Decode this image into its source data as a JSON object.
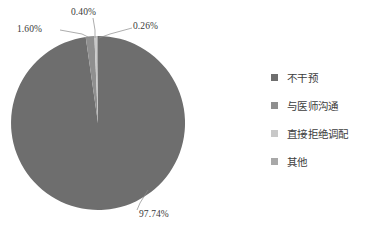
{
  "chart_data": {
    "type": "pie",
    "title": "",
    "categories": [
      "不干预",
      "与医师沟通",
      "直接拒绝调配",
      "其他"
    ],
    "values": [
      97.74,
      1.6,
      0.4,
      0.26
    ],
    "value_unit": "%",
    "data_labels": [
      "97.74%",
      "1.60%",
      "0.40%",
      "0.26%"
    ],
    "colors": [
      "#6e6e6e",
      "#8f8f8f",
      "#c8c8c8",
      "#a8a8a8"
    ],
    "legend_position": "right",
    "grid": false,
    "start_angle_deg": -90,
    "direction": "clockwise"
  },
  "labels": {
    "slice_main": "97.74%",
    "slice_second": "1.60%",
    "slice_third": "0.40%",
    "slice_fourth": "0.26%"
  },
  "legend": {
    "items": [
      {
        "label": "不干预",
        "color": "#6e6e6e"
      },
      {
        "label": "与医师沟通",
        "color": "#8f8f8f"
      },
      {
        "label": "直接拒绝调配",
        "color": "#c8c8c8"
      },
      {
        "label": "其他",
        "color": "#a8a8a8"
      }
    ]
  },
  "footer": {
    "clipped_caption": ""
  }
}
